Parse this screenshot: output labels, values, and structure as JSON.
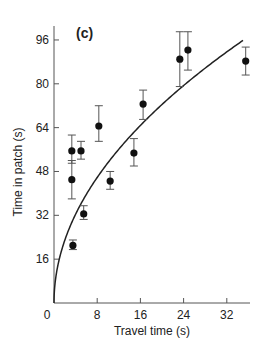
{
  "chart_data": {
    "type": "scatter",
    "panel_label": "(c)",
    "title": "",
    "xlabel": "Travel time (s)",
    "ylabel": "Time in patch (s)",
    "xlim": [
      0,
      36
    ],
    "ylim": [
      0,
      100
    ],
    "xticks": [
      0,
      8,
      16,
      24,
      32
    ],
    "yticks": [
      16,
      32,
      48,
      64,
      80,
      96
    ],
    "grid": false,
    "legend": null,
    "points": [
      {
        "x": 3.3,
        "y": 55.5,
        "err_low": 51,
        "err_high": 61.3
      },
      {
        "x": 3.3,
        "y": 45,
        "err_low": 38,
        "err_high": 52
      },
      {
        "x": 3.5,
        "y": 21,
        "err_low": 19.5,
        "err_high": 23
      },
      {
        "x": 5.0,
        "y": 55.5,
        "err_low": 52.5,
        "err_high": 59
      },
      {
        "x": 5.5,
        "y": 32.5,
        "err_low": 30.5,
        "err_high": 35.5
      },
      {
        "x": 8.3,
        "y": 64.6,
        "err_low": 59,
        "err_high": 72
      },
      {
        "x": 10.4,
        "y": 44.5,
        "err_low": 41.5,
        "err_high": 48
      },
      {
        "x": 14.8,
        "y": 54.7,
        "err_low": 50,
        "err_high": 60
      },
      {
        "x": 16.5,
        "y": 72.6,
        "err_low": 67,
        "err_high": 77.7
      },
      {
        "x": 23.3,
        "y": 89,
        "err_low": 79,
        "err_high": 99
      },
      {
        "x": 24.8,
        "y": 92.3,
        "err_low": 85,
        "err_high": 99
      },
      {
        "x": 35.5,
        "y": 88.3,
        "err_low": 83.2,
        "err_high": 93.4
      }
    ],
    "curve": {
      "type": "power",
      "formula": "y = 16.2 * x^0.5",
      "x_range": [
        0,
        35
      ]
    }
  }
}
